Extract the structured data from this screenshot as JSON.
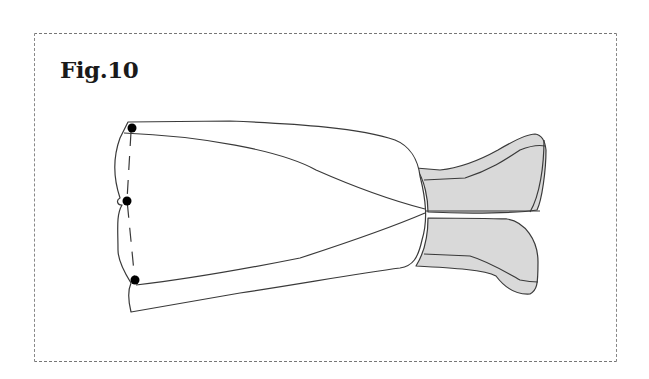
{
  "figure": {
    "label": "Fig.10",
    "colors": {
      "line": "#3a3a3a",
      "fill_grey": "#d9d9d9",
      "marker": "#000000",
      "frame": "#777777"
    },
    "markers": [
      {
        "name": "top-pin",
        "x": 132,
        "y": 128
      },
      {
        "name": "middle-pin",
        "x": 127,
        "y": 201
      },
      {
        "name": "bottom-pin",
        "x": 135,
        "y": 280
      }
    ]
  }
}
